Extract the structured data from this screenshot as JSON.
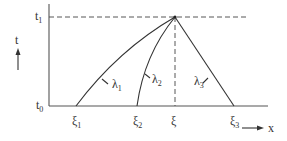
{
  "diagram": {
    "type": "characteristics-diagram",
    "axes": {
      "t_label": "t",
      "x_label": "x",
      "t0_label": "t",
      "t0_sub": "0",
      "t1_label": "t",
      "t1_sub": "1"
    },
    "points": [
      {
        "id": "xi1",
        "label": "ξ",
        "sub": "1"
      },
      {
        "id": "xi2",
        "label": "ξ",
        "sub": "2"
      },
      {
        "id": "xi",
        "label": "ξ",
        "sub": ""
      },
      {
        "id": "xi3",
        "label": "ξ",
        "sub": "3"
      }
    ],
    "characteristics": [
      {
        "label": "λ",
        "sub": "1"
      },
      {
        "label": "λ",
        "sub": "2"
      },
      {
        "label": "λ",
        "sub": "3"
      }
    ],
    "colors": {
      "line": "#333333",
      "axis": "#555555",
      "background": "#ffffff"
    }
  }
}
